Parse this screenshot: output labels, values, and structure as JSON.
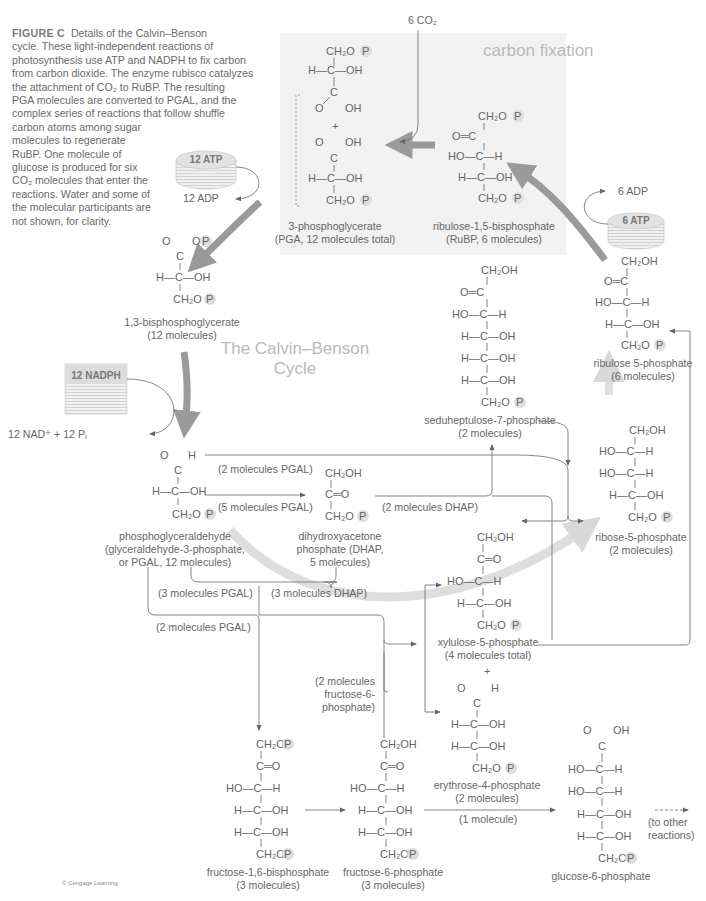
{
  "caption": {
    "figure_label": "FIGURE C",
    "lines": [
      "Details of the Calvin–Benson",
      "cycle. These light-independent reactions of",
      "photosynthesis use ATP and NADPH to fix carbon",
      "from carbon dioxide. The enzyme rubisco catalyzes",
      "the attachment of CO₂ to RuBP. The resulting",
      "PGA molecules are converted to PGAL, and the",
      "complex series of reactions that follow shuffle",
      "carbon atoms among sugar",
      "molecules to regenerate",
      "RuBP. One molecule of",
      "glucose is produced for six",
      "CO₂ molecules that enter the",
      "reactions. Water and some of",
      "the molecular participants are",
      "not shown, for clarity."
    ]
  },
  "titles": {
    "carbon_fixation": "carbon fixation",
    "cycle_line1": "The Calvin–Benson",
    "cycle_line2": "Cycle"
  },
  "inputs": {
    "co2": "6 CO₂",
    "atp12": "12 ATP",
    "adp12": "12 ADP",
    "atp6": "6 ATP",
    "adp6": "6 ADP",
    "nadph12": "12 NADPH",
    "nad_out": "12 NAD⁺ + 12 Pᵢ"
  },
  "molecules": {
    "pga": {
      "name": "3-phosphoglycerate",
      "count": "(PGA, 12 molecules total)"
    },
    "rubp": {
      "name": "ribulose-1,5-bisphosphate",
      "count": "(RuBP, 6 molecules)"
    },
    "bpg": {
      "name": "1,3-bisphosphoglycerate",
      "count": "(12 molecules)"
    },
    "ru5p": {
      "name": "ribulose 5-phosphate",
      "count": "(6 molecules)"
    },
    "s7p": {
      "name": "seduheptulose-7-phosphate",
      "count": "(2 molecules)"
    },
    "pgal": {
      "name": "phosphoglyceraldehyde",
      "alt": "(glyceraldehyde-3-phosphate,",
      "count": "or PGAL, 12 molecules)"
    },
    "dhap": {
      "name": "dihydroxyacetone",
      "alt": "phosphate (DHAP,",
      "count": "5 molecules)"
    },
    "r5p": {
      "name": "ribose-5-phosphate",
      "count": "(2 molecules)"
    },
    "x5p": {
      "name": "xylulose-5-phosphate",
      "count": "(4 molecules total)"
    },
    "e4p": {
      "name": "erythrose-4-phosphate",
      "count": "(2 molecules)"
    },
    "fbp": {
      "name": "fructose-1,6-bisphosphate",
      "count": "(3 molecules)"
    },
    "f6p": {
      "name": "fructose-6-phosphate",
      "count": "(3 molecules)"
    },
    "g6p": {
      "name": "glucose-6-phosphate"
    }
  },
  "flow_labels": {
    "pgal2_top": "(2 molecules PGAL)",
    "pgal5": "(5 molecules PGAL)",
    "dhap2": "(2 molecules DHAP)",
    "pgal3": "(3 molecules PGAL)",
    "dhap3": "(3 molecules DHAP)",
    "pgal2_bottom": "(2 molecules PGAL)",
    "f6p2_l1": "(2 molecules",
    "f6p2_l2": "fructose-6-",
    "f6p2_l3": "phosphate)",
    "one_molecule": "(1 molecule)",
    "to_other_l1": "(to other",
    "to_other_l2": "reactions)",
    "plus": "+"
  },
  "atoms": {
    "ch2op": "CH₂O",
    "ch2oh": "CH₂OH",
    "p": "P",
    "h_c_oh": "H—C—OH",
    "ho_c_h": "HO—C—H",
    "c_eq_o": "C═O",
    "o_eq_c": "O═C",
    "c": "C",
    "o": "O",
    "oh": "OH",
    "h": "H",
    "bar": "|"
  },
  "copyright": "© Cengage Learning",
  "colors": {
    "panel_bg": "#f2f2f2",
    "cycle_arrow": "#9a9a9a",
    "faint_arrow": "#d6d6d6",
    "phosphate_circle": "#dedede",
    "disk_top": "#e2e2e2",
    "text": "#666666"
  }
}
